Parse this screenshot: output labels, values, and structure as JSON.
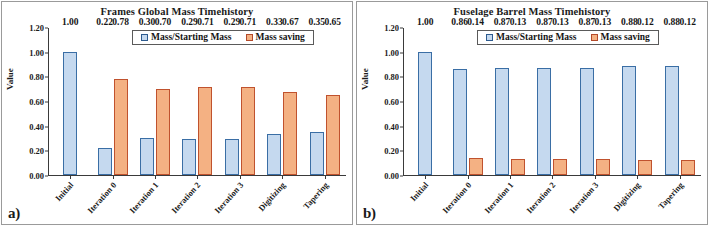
{
  "figure": {
    "panels": [
      {
        "panel_label": "a)",
        "chart_data": {
          "type": "bar",
          "title": "Frames Global Mass Timehistory",
          "xlabel": "",
          "ylabel": "Value",
          "ylim": [
            0.0,
            1.2
          ],
          "yticks": [
            "0.00",
            "0.20",
            "0.40",
            "0.60",
            "0.80",
            "1.00",
            "1.20"
          ],
          "ytick_values": [
            0.0,
            0.2,
            0.4,
            0.6,
            0.8,
            1.0,
            1.2
          ],
          "grid": false,
          "legend_position": "top-center",
          "categories": [
            "Initial",
            "Iteration 0",
            "Iteration 1",
            "Iteration 2",
            "Iteration 3",
            "Digitizing",
            "Tapering"
          ],
          "series": [
            {
              "name": "Mass/Starting Mass",
              "color": "#c5d9ef",
              "edge_color": "#3a6ea5",
              "values": [
                1.0,
                0.22,
                0.3,
                0.29,
                0.29,
                0.33,
                0.35
              ],
              "labels": [
                "1.00",
                "0.22",
                "0.30",
                "0.29",
                "0.29",
                "0.33",
                "0.35"
              ]
            },
            {
              "name": "Mass saving",
              "color": "#f4b183",
              "edge_color": "#c0522e",
              "values": [
                null,
                0.78,
                0.7,
                0.71,
                0.71,
                0.67,
                0.65
              ],
              "labels": [
                "",
                "0.78",
                "0.70",
                "0.71",
                "0.71",
                "0.67",
                "0.65"
              ]
            }
          ]
        }
      },
      {
        "panel_label": "b)",
        "chart_data": {
          "type": "bar",
          "title": "Fuselage Barrel Mass Timehistory",
          "xlabel": "",
          "ylabel": "Value",
          "ylim": [
            0.0,
            1.2
          ],
          "yticks": [
            "0.00",
            "0.20",
            "0.40",
            "0.60",
            "0.80",
            "1.00",
            "1.20"
          ],
          "ytick_values": [
            0.0,
            0.2,
            0.4,
            0.6,
            0.8,
            1.0,
            1.2
          ],
          "grid": false,
          "legend_position": "top-center",
          "categories": [
            "Initial",
            "Iteration 0",
            "Iteration 1",
            "Iteration 2",
            "Iteration 3",
            "Digitizing",
            "Tapering"
          ],
          "series": [
            {
              "name": "Mass/Starting Mass",
              "color": "#c5d9ef",
              "edge_color": "#3a6ea5",
              "values": [
                1.0,
                0.86,
                0.87,
                0.87,
                0.87,
                0.88,
                0.88
              ],
              "labels": [
                "1.00",
                "0.86",
                "0.87",
                "0.87",
                "0.87",
                "0.88",
                "0.88"
              ]
            },
            {
              "name": "Mass saving",
              "color": "#f4b183",
              "edge_color": "#c0522e",
              "values": [
                null,
                0.14,
                0.13,
                0.13,
                0.13,
                0.12,
                0.12
              ],
              "labels": [
                "",
                "0.14",
                "0.13",
                "0.13",
                "0.13",
                "0.12",
                "0.12"
              ]
            }
          ]
        }
      }
    ]
  }
}
